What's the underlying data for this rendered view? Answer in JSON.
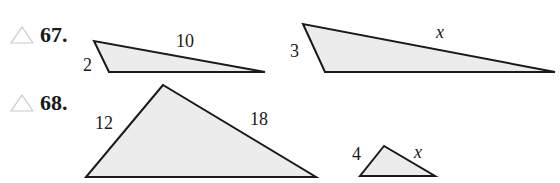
{
  "problems": [
    {
      "number": "67.",
      "icon": "triangle-outline-icon",
      "triangles": [
        {
          "labels": {
            "short": "2",
            "long": "10"
          }
        },
        {
          "labels": {
            "short": "3",
            "long": "x"
          }
        }
      ]
    },
    {
      "number": "68.",
      "icon": "triangle-outline-icon",
      "triangles": [
        {
          "labels": {
            "left": "12",
            "right": "18"
          }
        },
        {
          "labels": {
            "left": "4",
            "right": "x"
          }
        }
      ]
    }
  ],
  "colors": {
    "fill": "#ececec",
    "stroke": "#1a1a1a",
    "icon": "#c8c8c8"
  }
}
